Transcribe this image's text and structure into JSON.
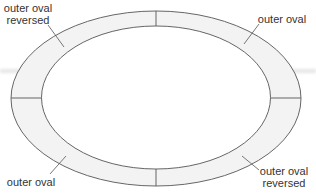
{
  "diagram": {
    "type": "oval ring divided into four quadrant segments",
    "colors": {
      "stroke": "#555555",
      "band_fill": "#f3f3f3",
      "inner_fill": "#ffffff",
      "text": "#333333",
      "haze": "#e6e6e6"
    },
    "labels": [
      {
        "id": "top-left",
        "line1": "outer oval",
        "line2": "reversed"
      },
      {
        "id": "top-right",
        "line1": "outer oval",
        "line2": ""
      },
      {
        "id": "bottom-left",
        "line1": "outer oval",
        "line2": ""
      },
      {
        "id": "bottom-right",
        "line1": "outer oval",
        "line2": "reversed"
      }
    ]
  }
}
